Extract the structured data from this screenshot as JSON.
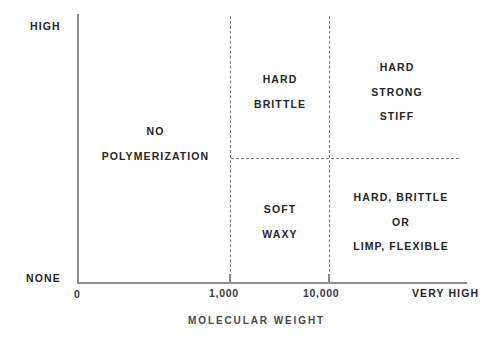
{
  "chart_data": {
    "type": "diagram",
    "title": "",
    "xlabel": "MOLECULAR WEIGHT",
    "ylabel": "CRYSTALLINITY",
    "grid": false,
    "legend_position": "none",
    "x_axis": {
      "label": "MOLECULAR WEIGHT",
      "tick_labels": [
        "0",
        "1,000",
        "10,000",
        "VERY HIGH"
      ],
      "tick_values": [
        0,
        1000,
        10000,
        null
      ],
      "ticks_drawn_at": [
        "1,000",
        "10,000"
      ]
    },
    "y_axis": {
      "label": "CRYSTALLINITY",
      "tick_labels": [
        "HIGH",
        "NONE"
      ],
      "range_top_label": "HIGH",
      "range_bottom_label": "NONE"
    },
    "dividers": {
      "vertical_at": [
        "1,000",
        "10,000"
      ],
      "horizontal_at_mid_crystallinity": true,
      "style": "dashed"
    },
    "regions": [
      {
        "name": "no-polymerization",
        "lines": [
          "NO",
          "POLYMERIZATION"
        ],
        "x_range": "0 to 1,000",
        "y_range": "NONE to HIGH"
      },
      {
        "name": "hard-brittle",
        "lines": [
          "HARD",
          "BRITTLE"
        ],
        "x_range": "1,000 to 10,000",
        "y_range": "mid to HIGH"
      },
      {
        "name": "hard-strong-stiff",
        "lines": [
          "HARD",
          "STRONG",
          "STIFF"
        ],
        "x_range": "10,000 to VERY HIGH",
        "y_range": "mid to HIGH"
      },
      {
        "name": "soft-waxy",
        "lines": [
          "SOFT",
          "WAXY"
        ],
        "x_range": "1,000 to 10,000",
        "y_range": "NONE to mid"
      },
      {
        "name": "hard-brittle-or-limp-flexible",
        "lines": [
          "HARD, BRITTLE",
          "OR",
          "LIMP, FLEXIBLE"
        ],
        "x_range": "10,000 to VERY HIGH",
        "y_range": "NONE to mid"
      }
    ],
    "colors": {
      "background": "#ffffff",
      "axis": "#8d8d8d",
      "divider": "#7f7f7f",
      "text": "#262626",
      "axis_title_text": "#4a4a4a"
    }
  },
  "axis": {
    "y_high_label": "HIGH",
    "y_none_label": "NONE",
    "y_title": "CRYSTALLINITY",
    "x_title": "MOLECULAR WEIGHT",
    "x_zero_label": "0",
    "x_1000_label": "1,000",
    "x_10000_label": "10,000",
    "x_very_high_label": "VERY HIGH"
  },
  "regions": {
    "no_polymerization": {
      "line1": "NO",
      "line2": "POLYMERIZATION"
    },
    "hard_brittle": {
      "line1": "HARD",
      "line2": "BRITTLE"
    },
    "hard_strong_stiff": {
      "line1": "HARD",
      "line2": "STRONG",
      "line3": "STIFF"
    },
    "soft_waxy": {
      "line1": "SOFT",
      "line2": "WAXY"
    },
    "hard_brittle_limp_flexible": {
      "line1": "HARD, BRITTLE",
      "line2": "OR",
      "line3": "LIMP, FLEXIBLE"
    }
  }
}
